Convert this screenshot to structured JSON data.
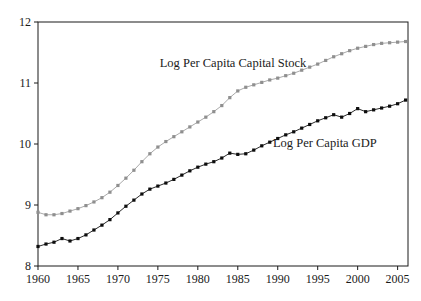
{
  "figure": {
    "background": "#ffffff",
    "border_color": "#1a1a1a"
  },
  "chart_data": {
    "type": "line",
    "title": "",
    "xlabel": "",
    "ylabel": "",
    "grid": false,
    "frame": true,
    "legend": "in-plot text annotations",
    "xlim": [
      1960,
      2006.3
    ],
    "ylim": [
      8,
      12
    ],
    "xticks": [
      1960,
      1965,
      1970,
      1975,
      1980,
      1985,
      1990,
      1995,
      2000,
      2005
    ],
    "yticks": [
      8,
      9,
      10,
      11,
      12
    ],
    "x": [
      1960,
      1961,
      1962,
      1963,
      1964,
      1965,
      1966,
      1967,
      1968,
      1969,
      1970,
      1971,
      1972,
      1973,
      1974,
      1975,
      1976,
      1977,
      1978,
      1979,
      1980,
      1981,
      1982,
      1983,
      1984,
      1985,
      1986,
      1987,
      1988,
      1989,
      1990,
      1991,
      1992,
      1993,
      1994,
      1995,
      1996,
      1997,
      1998,
      1999,
      2000,
      2001,
      2002,
      2003,
      2004,
      2005,
      2006
    ],
    "series": [
      {
        "name": "Log Per Capita Capital Stock",
        "marker": "square",
        "line_color": "#aaaaaa",
        "marker_color": "#8f8f8f",
        "values": [
          8.88,
          8.84,
          8.84,
          8.86,
          8.9,
          8.94,
          8.99,
          9.05,
          9.12,
          9.21,
          9.32,
          9.44,
          9.57,
          9.71,
          9.84,
          9.95,
          10.04,
          10.12,
          10.2,
          10.28,
          10.36,
          10.44,
          10.53,
          10.63,
          10.76,
          10.87,
          10.93,
          10.97,
          11.01,
          11.05,
          11.08,
          11.12,
          11.16,
          11.21,
          11.26,
          11.31,
          11.37,
          11.43,
          11.48,
          11.53,
          11.57,
          11.6,
          11.63,
          11.65,
          11.66,
          11.67,
          11.68
        ]
      },
      {
        "name": "Log Per Capita GDP",
        "marker": "square",
        "line_color": "#2b2b2b",
        "marker_color": "#0d0d0d",
        "values": [
          8.32,
          8.36,
          8.39,
          8.45,
          8.41,
          8.45,
          8.51,
          8.59,
          8.67,
          8.76,
          8.87,
          8.98,
          9.08,
          9.18,
          9.26,
          9.31,
          9.36,
          9.42,
          9.49,
          9.56,
          9.62,
          9.67,
          9.71,
          9.77,
          9.85,
          9.83,
          9.84,
          9.9,
          9.97,
          10.03,
          10.09,
          10.15,
          10.2,
          10.26,
          10.32,
          10.38,
          10.43,
          10.48,
          10.44,
          10.5,
          10.58,
          10.53,
          10.56,
          10.59,
          10.62,
          10.66,
          10.72
        ]
      }
    ],
    "annotations": [
      {
        "text": "Log Per Capita Capital Stock",
        "x": 1984.4,
        "y": 11.27
      },
      {
        "text": "Log Per Capita GDP",
        "x": 1995.9,
        "y": 9.95
      }
    ]
  }
}
